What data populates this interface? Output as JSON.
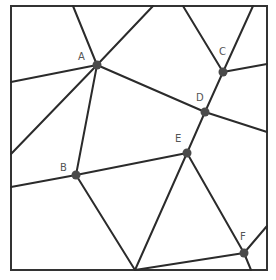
{
  "diagram": {
    "type": "planar-graph",
    "frame": {
      "x": 11,
      "y": 6,
      "width": 256,
      "height": 264,
      "color": "#333333"
    },
    "edge_color": "#2b2b2b",
    "node_color": "#4a4a4a",
    "label_color": "#555555",
    "nodes": [
      {
        "id": "A",
        "label": "A",
        "x": 97,
        "y": 65,
        "lx": 78,
        "ly": 60
      },
      {
        "id": "B",
        "label": "B",
        "x": 76,
        "y": 175,
        "lx": 60,
        "ly": 171
      },
      {
        "id": "C",
        "label": "C",
        "x": 223,
        "y": 72,
        "lx": 219,
        "ly": 55
      },
      {
        "id": "D",
        "label": "D",
        "x": 205,
        "y": 112,
        "lx": 196,
        "ly": 101
      },
      {
        "id": "E",
        "label": "E",
        "x": 187,
        "y": 153,
        "lx": 175,
        "ly": 142
      },
      {
        "id": "F",
        "label": "F",
        "x": 244,
        "y": 253,
        "lx": 240,
        "ly": 240
      }
    ],
    "edges": [
      {
        "x1": 73,
        "y1": 6,
        "x2": 97,
        "y2": 65
      },
      {
        "x1": 153,
        "y1": 6,
        "x2": 97,
        "y2": 65
      },
      {
        "x1": 11,
        "y1": 82,
        "x2": 97,
        "y2": 65
      },
      {
        "x1": 97,
        "y1": 65,
        "x2": 205,
        "y2": 112
      },
      {
        "x1": 97,
        "y1": 65,
        "x2": 11,
        "y2": 154
      },
      {
        "x1": 97,
        "y1": 65,
        "x2": 76,
        "y2": 175
      },
      {
        "x1": 183,
        "y1": 6,
        "x2": 223,
        "y2": 72
      },
      {
        "x1": 253,
        "y1": 6,
        "x2": 223,
        "y2": 72
      },
      {
        "x1": 223,
        "y1": 72,
        "x2": 267,
        "y2": 64
      },
      {
        "x1": 223,
        "y1": 72,
        "x2": 205,
        "y2": 112
      },
      {
        "x1": 205,
        "y1": 112,
        "x2": 267,
        "y2": 132
      },
      {
        "x1": 205,
        "y1": 112,
        "x2": 187,
        "y2": 153
      },
      {
        "x1": 11,
        "y1": 187,
        "x2": 76,
        "y2": 175
      },
      {
        "x1": 76,
        "y1": 175,
        "x2": 187,
        "y2": 153
      },
      {
        "x1": 76,
        "y1": 175,
        "x2": 135,
        "y2": 270
      },
      {
        "x1": 187,
        "y1": 153,
        "x2": 135,
        "y2": 270
      },
      {
        "x1": 187,
        "y1": 153,
        "x2": 244,
        "y2": 253
      },
      {
        "x1": 135,
        "y1": 270,
        "x2": 244,
        "y2": 253
      },
      {
        "x1": 244,
        "y1": 253,
        "x2": 267,
        "y2": 226
      },
      {
        "x1": 244,
        "y1": 253,
        "x2": 251,
        "y2": 270
      }
    ]
  }
}
